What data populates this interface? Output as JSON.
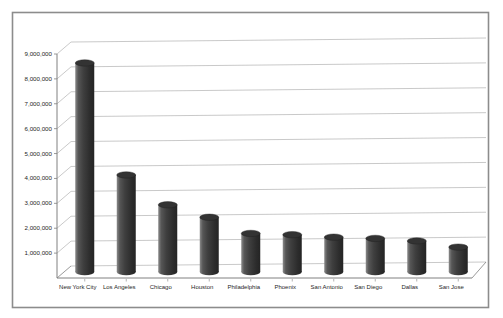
{
  "chart_data": {
    "type": "bar",
    "style": "3d-cylinder",
    "title": "",
    "xlabel": "",
    "ylabel": "",
    "legend": "none",
    "grid": true,
    "categories": [
      "New York City",
      "Los Angeles",
      "Chicago",
      "Houston",
      "Philadelphia",
      "Phoenix",
      "San Antonio",
      "San Diego",
      "Dallas",
      "San Jose"
    ],
    "values": [
      8400000,
      3900000,
      2700000,
      2200000,
      1550000,
      1500000,
      1400000,
      1350000,
      1250000,
      1000000
    ],
    "y_axis": {
      "min": 0,
      "max": 9000000,
      "tick_labels": [
        "1,000,000",
        "2,000,000",
        "3,000,000",
        "4,000,000",
        "5,000,000",
        "6,000,000",
        "7,000,000",
        "8,000,000",
        "9,000,000"
      ]
    },
    "colors": {
      "bar_body_light": "#8a8a8a",
      "bar_body": "#3f3f3f",
      "bar_body_dark": "#242424",
      "bar_top": "#333333",
      "gridline": "#c3c3c3",
      "axis": "#808080",
      "frame_border": "#8c8c8c",
      "text": "#262626",
      "background": "#ffffff"
    }
  }
}
